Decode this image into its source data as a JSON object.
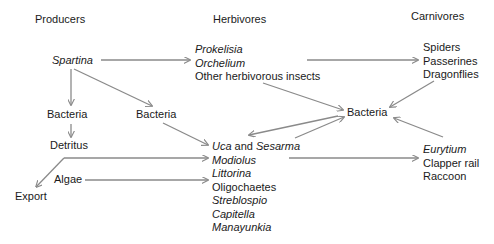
{
  "headers": {
    "producers": "Producers",
    "herbivores": "Herbivores",
    "carnivores": "Carnivores"
  },
  "producers": {
    "spartina": "Spartina",
    "bacteria_left": "Bacteria",
    "bacteria_mid": "Bacteria",
    "detritus": "Detritus",
    "algae": "Algae",
    "export": "Export"
  },
  "herbivores": {
    "insects": [
      "Prokelisia",
      "Orchelium",
      "Other herbivorous insects"
    ],
    "benthic": {
      "uca": "Uca",
      "and": " and ",
      "sesarma": "Sesarma",
      "list": [
        "Modiolus",
        "Littorina",
        "Oligochaetes",
        "Streblospio",
        "Capitella",
        "Manayunkia"
      ]
    }
  },
  "center": {
    "bacteria": "Bacteria"
  },
  "carnivores": {
    "top": [
      "Spiders",
      "Passerines",
      "Dragonflies"
    ],
    "bottom": [
      "Eurytium",
      "Clapper rail",
      "Raccoon"
    ]
  },
  "colors": {
    "arrow": "#8a8a8a",
    "text": "#1a1a1a"
  }
}
